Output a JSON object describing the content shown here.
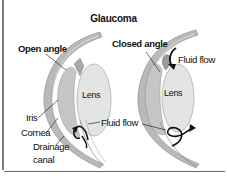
{
  "diagram": {
    "title": "Glaucoma",
    "left_panel": {
      "type": "open-angle",
      "labels": {
        "angle": "Open angle",
        "lens": "Lens",
        "iris": "Iris",
        "cornea": "Cornea",
        "drainage_line1": "Drainage",
        "drainage_line2": "canal"
      }
    },
    "right_panel": {
      "type": "closed-angle",
      "labels": {
        "angle": "Closed angle",
        "lens": "Lens",
        "fluid_flow": "Fluid flow"
      }
    },
    "shared_labels": {
      "fluid_flow": "Fluid flow"
    },
    "colors": {
      "cornea": "#b9b9b9",
      "cornea_edge": "#8a8a8a",
      "iris": "#c8c8c8",
      "lens": "#e4e4e4",
      "arrow": "#111111",
      "border": "#7a7a7a"
    }
  }
}
